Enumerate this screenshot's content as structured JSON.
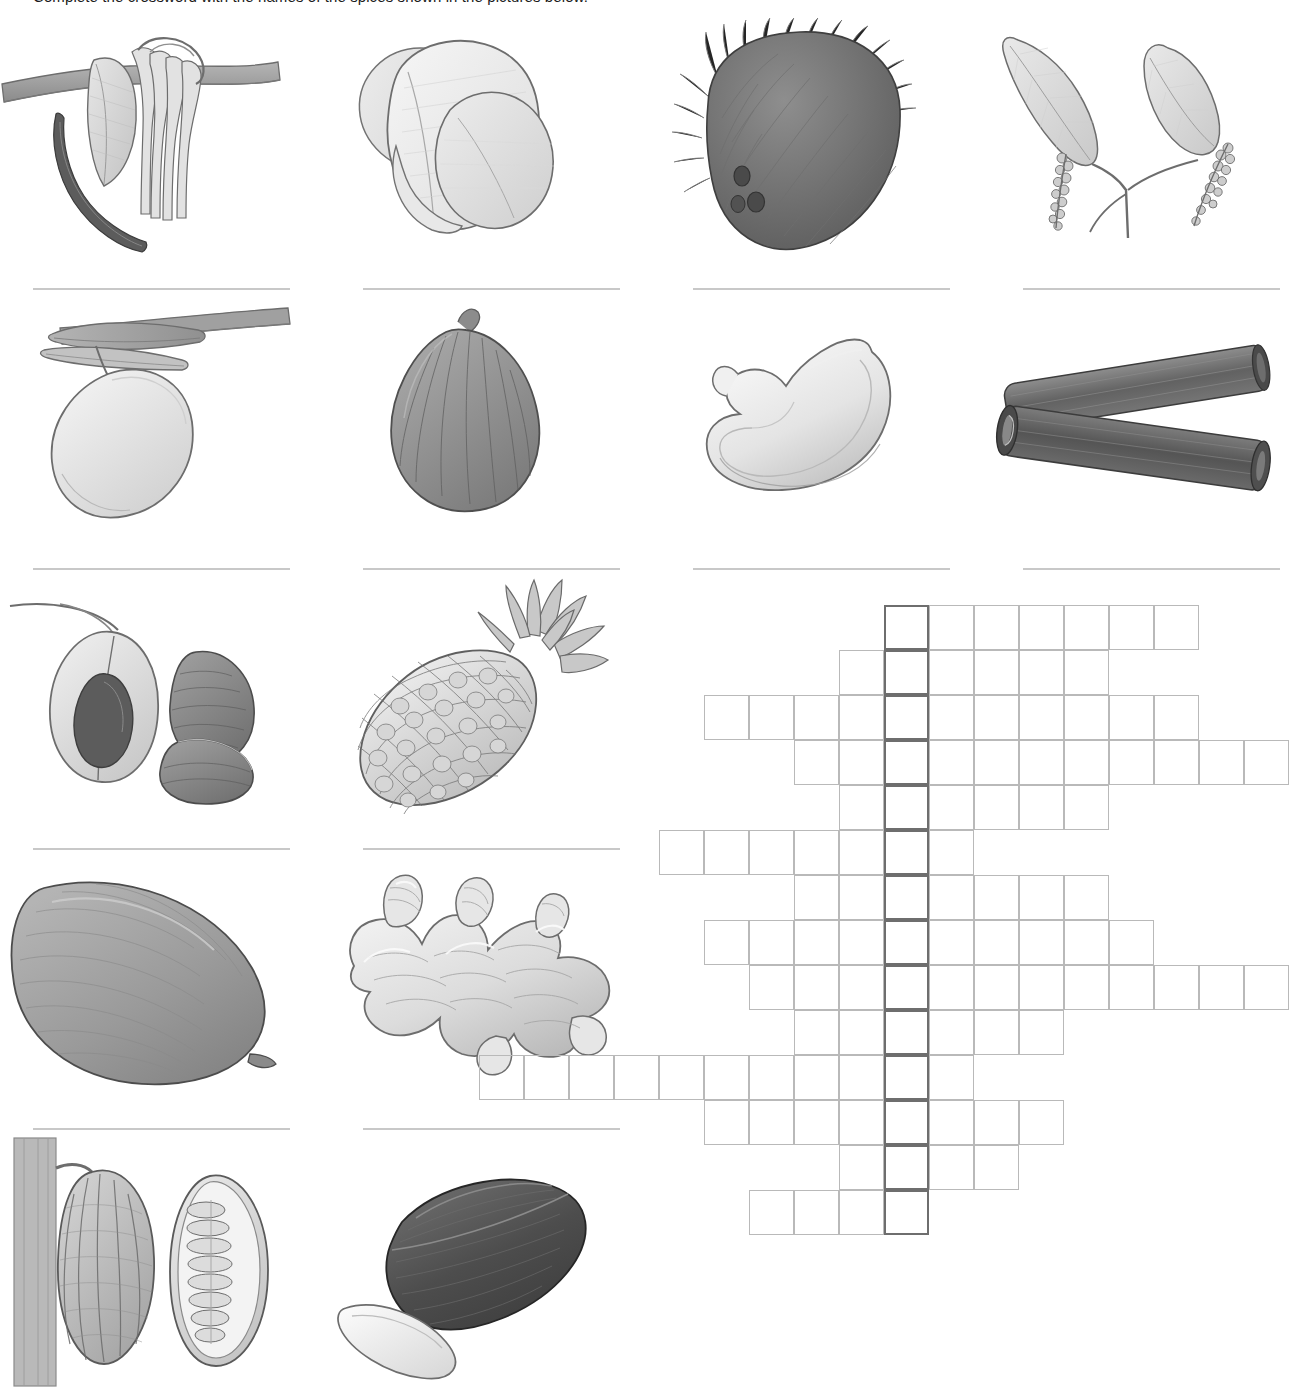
{
  "worksheet": {
    "instructions": "Complete the crossword with the names of the spices shown in the pictures below."
  },
  "illustrations": [
    {
      "id": "vanilla",
      "label": "vanilla-orchid-and-pods",
      "row": 0,
      "col": 0,
      "answer_line": true
    },
    {
      "id": "cardamom",
      "label": "cardamom-pods",
      "row": 0,
      "col": 1,
      "answer_line": true
    },
    {
      "id": "coconut",
      "label": "hairy-coconut",
      "row": 0,
      "col": 2,
      "answer_line": true
    },
    {
      "id": "pepper",
      "label": "pepper-vine-with-peppercorns",
      "row": 0,
      "col": 3,
      "answer_line": true
    },
    {
      "id": "mango",
      "label": "mango-on-branch",
      "row": 1,
      "col": 0,
      "answer_line": true
    },
    {
      "id": "fig",
      "label": "fig-fruit",
      "row": 1,
      "col": 1,
      "answer_line": true
    },
    {
      "id": "cashew",
      "label": "cashew-nut",
      "row": 1,
      "col": 2,
      "answer_line": true
    },
    {
      "id": "cinnamon",
      "label": "cinnamon-sticks",
      "row": 1,
      "col": 3,
      "answer_line": true
    },
    {
      "id": "nutmeg",
      "label": "nutmeg-and-mace",
      "row": 2,
      "col": 0,
      "answer_line": true
    },
    {
      "id": "pineapple",
      "label": "pineapple",
      "row": 2,
      "col": 1,
      "answer_line": true
    },
    {
      "id": "avocado",
      "label": "avocado",
      "row": 3,
      "col": 0,
      "answer_line": true
    },
    {
      "id": "ginger",
      "label": "ginger-root",
      "row": 3,
      "col": 1,
      "answer_line": true
    },
    {
      "id": "cocoa",
      "label": "cocoa-pod-whole-and-halved",
      "row": 4,
      "col": 0,
      "answer_line": false
    },
    {
      "id": "tamarind",
      "label": "tamarind-pod-and-seed",
      "row": 4,
      "col": 1,
      "answer_line": false
    }
  ],
  "crossword": {
    "cell_size": 45,
    "key_column": 9,
    "rows": 14,
    "cols": 18,
    "entries": [
      {
        "number": 1,
        "row": 0,
        "start_col": 9,
        "length": 7
      },
      {
        "number": 2,
        "row": 1,
        "start_col": 8,
        "length": 6
      },
      {
        "number": 3,
        "row": 2,
        "start_col": 5,
        "length": 11
      },
      {
        "number": 4,
        "row": 3,
        "start_col": 7,
        "length": 11
      },
      {
        "number": 5,
        "row": 4,
        "start_col": 8,
        "length": 6
      },
      {
        "number": 6,
        "row": 5,
        "start_col": 4,
        "length": 7
      },
      {
        "number": 7,
        "row": 6,
        "start_col": 7,
        "length": 7
      },
      {
        "number": 8,
        "row": 7,
        "start_col": 5,
        "length": 10
      },
      {
        "number": 9,
        "row": 8,
        "start_col": 6,
        "length": 12
      },
      {
        "number": 10,
        "row": 9,
        "start_col": 7,
        "length": 6
      },
      {
        "number": 11,
        "row": 10,
        "start_col": 0,
        "length": 11
      },
      {
        "number": 12,
        "row": 11,
        "start_col": 5,
        "length": 8
      },
      {
        "number": 13,
        "row": 12,
        "start_col": 8,
        "length": 4
      },
      {
        "number": 14,
        "row": 13,
        "start_col": 6,
        "length": 4
      }
    ],
    "key_entry": {
      "orientation": "down",
      "start_row": 0,
      "col": 9,
      "length": 14
    }
  },
  "colors": {
    "paper": "#ffffff",
    "grid_line": "#b9b9b9",
    "key_cell_line": "#6e6e6e",
    "answer_line": "#c8c8c8",
    "ink": "#1a1a1a",
    "art_dark": "#555555",
    "art_mid": "#8e8e8e",
    "art_light": "#d9d9d9",
    "art_pale": "#efefef"
  }
}
